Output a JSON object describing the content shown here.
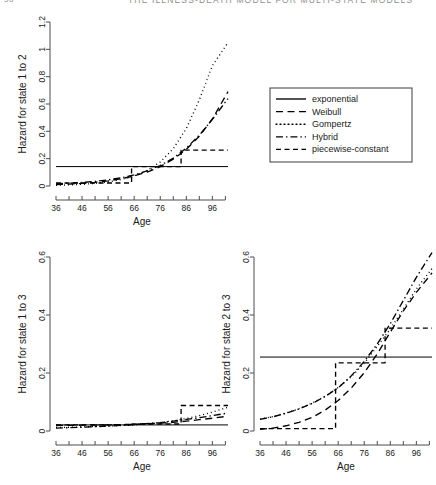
{
  "page": {
    "folio": "56",
    "running_head": "THE ILLNESS-DEATH MODEL FOR MULTI-STATE MODELS"
  },
  "legend": {
    "title": "",
    "entries": [
      {
        "label": "exponential",
        "style": "solid"
      },
      {
        "label": "Weibull",
        "style": "dashed"
      },
      {
        "label": "Gompertz",
        "style": "dotted"
      },
      {
        "label": "Hybrid",
        "style": "dashdot"
      },
      {
        "label": "piecewise-constant",
        "style": "longdash"
      }
    ]
  },
  "chart_data": [
    {
      "id": "hazard-1-2",
      "type": "line",
      "title": "",
      "xlabel": "Age",
      "ylabel": "Hazard for state 1 to 2",
      "xlim": [
        36,
        102
      ],
      "ylim": [
        0,
        1.2
      ],
      "xticks": [
        36,
        46,
        56,
        66,
        76,
        86,
        96
      ],
      "xminor": [
        41,
        51,
        61,
        71,
        81,
        91,
        101
      ],
      "yticks": [
        0,
        0.2,
        0.4,
        0.6,
        0.8,
        1,
        1.2
      ],
      "ytick_labels": [
        "0",
        "0.2",
        "0.4",
        "0.6",
        "0.8",
        "1",
        "1.2"
      ],
      "grid": false,
      "series": [
        {
          "name": "exponential",
          "style": "solid",
          "x": [
            36,
            102
          ],
          "y": [
            0.142,
            0.142
          ]
        },
        {
          "name": "Weibull",
          "style": "dashed",
          "x": [
            36,
            41,
            46,
            51,
            56,
            61,
            66,
            71,
            76,
            81,
            86,
            91,
            96,
            102
          ],
          "y": [
            0.01,
            0.014,
            0.019,
            0.027,
            0.038,
            0.053,
            0.074,
            0.102,
            0.142,
            0.196,
            0.268,
            0.364,
            0.49,
            0.69
          ]
        },
        {
          "name": "Gompertz",
          "style": "dotted",
          "x": [
            36,
            41,
            46,
            51,
            56,
            61,
            66,
            71,
            76,
            81,
            86,
            91,
            96,
            102
          ],
          "y": [
            0.005,
            0.008,
            0.012,
            0.019,
            0.03,
            0.047,
            0.073,
            0.113,
            0.176,
            0.273,
            0.42,
            0.63,
            0.88,
            1.05
          ]
        },
        {
          "name": "Hybrid",
          "style": "dashdot",
          "x": [
            36,
            41,
            46,
            51,
            56,
            61,
            66,
            71,
            76,
            81,
            86,
            91,
            96,
            102
          ],
          "y": [
            0.016,
            0.02,
            0.026,
            0.034,
            0.045,
            0.06,
            0.081,
            0.11,
            0.15,
            0.204,
            0.277,
            0.372,
            0.487,
            0.64
          ]
        },
        {
          "name": "piecewise-constant",
          "style": "longdash",
          "step": true,
          "x": [
            36,
            65,
            65,
            84,
            84,
            102
          ],
          "y": [
            0.022,
            0.022,
            0.142,
            0.142,
            0.262,
            0.262
          ]
        }
      ]
    },
    {
      "id": "hazard-1-3",
      "type": "line",
      "title": "",
      "xlabel": "Age",
      "ylabel": "Hazard for state 1 to 3",
      "xlim": [
        36,
        102
      ],
      "ylim": [
        0,
        0.6
      ],
      "xticks": [
        36,
        46,
        56,
        66,
        76,
        86,
        96
      ],
      "xminor": [
        41,
        51,
        61,
        71,
        81,
        91,
        101
      ],
      "yticks": [
        0,
        0.2,
        0.4,
        0.6
      ],
      "ytick_labels": [
        "0",
        "0.2",
        "0.4",
        "0.6"
      ],
      "grid": false,
      "series": [
        {
          "name": "exponential",
          "style": "solid",
          "x": [
            36,
            102
          ],
          "y": [
            0.021,
            0.021
          ]
        },
        {
          "name": "Weibull",
          "style": "dashed",
          "x": [
            36,
            46,
            56,
            66,
            76,
            81,
            86,
            91,
            96,
            102
          ],
          "y": [
            0.019,
            0.02,
            0.021,
            0.023,
            0.027,
            0.03,
            0.034,
            0.039,
            0.044,
            0.051
          ]
        },
        {
          "name": "Gompertz",
          "style": "dotted",
          "x": [
            36,
            46,
            56,
            66,
            76,
            81,
            86,
            91,
            96,
            102
          ],
          "y": [
            0.012,
            0.014,
            0.017,
            0.021,
            0.029,
            0.035,
            0.043,
            0.053,
            0.065,
            0.082
          ]
        },
        {
          "name": "Hybrid",
          "style": "dashdot",
          "x": [
            36,
            46,
            56,
            66,
            76,
            81,
            86,
            91,
            96,
            102
          ],
          "y": [
            0.01,
            0.013,
            0.017,
            0.022,
            0.029,
            0.034,
            0.04,
            0.046,
            0.053,
            0.062
          ]
        },
        {
          "name": "piecewise-constant",
          "style": "longdash",
          "step": true,
          "x": [
            36,
            65,
            65,
            84,
            84,
            102
          ],
          "y": [
            0.021,
            0.021,
            0.024,
            0.024,
            0.088,
            0.088
          ]
        }
      ]
    },
    {
      "id": "hazard-2-3",
      "type": "line",
      "title": "",
      "xlabel": "Age",
      "ylabel": "Hazard for state 2 to 3",
      "xlim": [
        36,
        102
      ],
      "ylim": [
        0,
        0.6
      ],
      "xticks": [
        36,
        46,
        56,
        66,
        76,
        86,
        96
      ],
      "xminor": [
        41,
        51,
        61,
        71,
        81,
        91,
        101
      ],
      "yticks": [
        0,
        0.2,
        0.4,
        0.6
      ],
      "ytick_labels": [
        "0",
        "0.2",
        "0.4",
        "0.6"
      ],
      "grid": false,
      "series": [
        {
          "name": "exponential",
          "style": "solid",
          "x": [
            36,
            102
          ],
          "y": [
            0.255,
            0.255
          ]
        },
        {
          "name": "Weibull",
          "style": "dashed",
          "x": [
            36,
            41,
            46,
            51,
            56,
            61,
            66,
            71,
            76,
            81,
            86,
            91,
            96,
            102
          ],
          "y": [
            0.006,
            0.01,
            0.018,
            0.03,
            0.047,
            0.072,
            0.105,
            0.148,
            0.201,
            0.266,
            0.341,
            0.414,
            0.478,
            0.545
          ]
        },
        {
          "name": "Gompertz",
          "style": "dotted",
          "x": [
            36,
            41,
            46,
            51,
            56,
            61,
            66,
            71,
            76,
            81,
            86,
            91,
            96,
            102
          ],
          "y": [
            0.041,
            0.05,
            0.062,
            0.077,
            0.096,
            0.12,
            0.15,
            0.187,
            0.234,
            0.292,
            0.352,
            0.42,
            0.49,
            0.56
          ]
        },
        {
          "name": "Hybrid",
          "style": "dashdot",
          "x": [
            36,
            41,
            46,
            51,
            56,
            61,
            66,
            71,
            76,
            81,
            86,
            91,
            96,
            102
          ],
          "y": [
            0.04,
            0.049,
            0.061,
            0.076,
            0.095,
            0.119,
            0.149,
            0.19,
            0.24,
            0.3,
            0.37,
            0.45,
            0.53,
            0.615
          ]
        },
        {
          "name": "piecewise-constant",
          "style": "longdash",
          "step": true,
          "x": [
            36,
            65,
            65,
            84,
            84,
            102
          ],
          "y": [
            0.008,
            0.008,
            0.235,
            0.235,
            0.355,
            0.355
          ]
        }
      ]
    }
  ]
}
